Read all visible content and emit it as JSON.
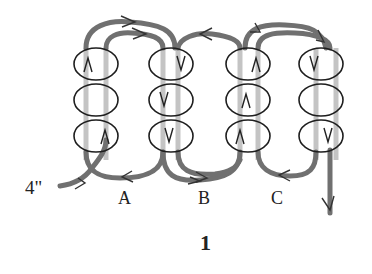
{
  "diagram": {
    "type": "bead-stitch-thread-path",
    "figure_number": "1",
    "start_label": "4\"",
    "column_labels": [
      "A",
      "B",
      "C"
    ],
    "colors": {
      "thread_dark": "#6e6e6e",
      "thread_light": "#c2c2c2",
      "bead_outline": "#1e1e1e",
      "text": "#222222"
    },
    "columns": [
      {
        "index": 1,
        "beads": [
          "up",
          "none",
          "up"
        ]
      },
      {
        "index": 2,
        "beads": [
          "down",
          "down",
          "down"
        ]
      },
      {
        "index": 3,
        "beads": [
          "up",
          "up",
          "up"
        ]
      },
      {
        "index": 4,
        "beads": [
          "down",
          "none",
          "down"
        ]
      }
    ]
  }
}
